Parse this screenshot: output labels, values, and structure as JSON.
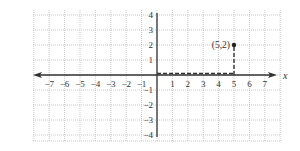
{
  "chart_data": {
    "type": "scatter",
    "title": "",
    "xlabel": "x",
    "ylabel": "",
    "xlim": [
      -8,
      8
    ],
    "ylim": [
      -4,
      4
    ],
    "grid": true,
    "grid_style": "dotted",
    "x_ticks": [
      -7,
      -6,
      -5,
      -4,
      -3,
      -2,
      -1,
      1,
      2,
      3,
      4,
      5,
      6,
      7
    ],
    "x_tick_labels": [
      "−7",
      "−6",
      "−5",
      "−4",
      "−3",
      "−2",
      "−1",
      "1",
      "2",
      "3",
      "4",
      "5",
      "6",
      "7"
    ],
    "y_ticks": [
      4,
      3,
      2,
      1,
      -1,
      -2,
      -3,
      -4
    ],
    "y_tick_labels": [
      "4",
      "3",
      "2",
      "1",
      "−1",
      "−2",
      "−3",
      "−4"
    ],
    "points": [
      {
        "x": 5,
        "y": 2,
        "label": "(5,2)"
      }
    ],
    "annotations": [
      {
        "type": "dashed-segment",
        "from": [
          0,
          0
        ],
        "to": [
          5,
          0
        ],
        "note": "horizontal dashed guide along x-axis"
      },
      {
        "type": "dashed-segment",
        "from": [
          5,
          0
        ],
        "to": [
          5,
          2
        ],
        "note": "vertical dashed guide up to point"
      }
    ],
    "x_axis_arrows": [
      "left",
      "right"
    ],
    "y_axis_arrows": []
  },
  "labels": {
    "x_axis": "x",
    "point": "(5,2)"
  },
  "colors": {
    "grid": "#bbbbbb",
    "axis": "#333333",
    "point": "#222222",
    "dashed": "#333333"
  }
}
